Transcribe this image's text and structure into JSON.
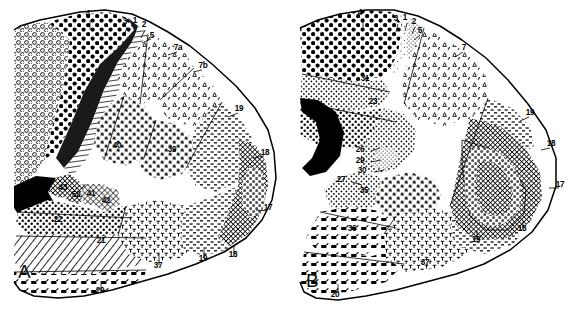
{
  "figure": {
    "background_color": "#ffffff",
    "ink_color": "#000000",
    "width": 574,
    "height": 318
  },
  "panels": [
    {
      "id": "A",
      "letter": "A",
      "view": "lateral",
      "letter_x": 18,
      "letter_y": 278,
      "labels": [
        {
          "text": "4",
          "x": 88,
          "y": 16,
          "lx1": 90,
          "ly1": 20,
          "lx2": 90,
          "ly2": 30
        },
        {
          "text": "3",
          "x": 125,
          "y": 24,
          "lx1": 127,
          "ly1": 27,
          "lx2": 124,
          "ly2": 36
        },
        {
          "text": "1",
          "x": 135,
          "y": 23,
          "lx1": 137,
          "ly1": 27,
          "lx2": 134,
          "ly2": 36
        },
        {
          "text": "2",
          "x": 144,
          "y": 27,
          "lx1": 145,
          "ly1": 30,
          "lx2": 141,
          "ly2": 38
        },
        {
          "text": "5",
          "x": 152,
          "y": 38,
          "lx1": 151,
          "ly1": 39,
          "lx2": 142,
          "ly2": 43
        },
        {
          "text": "7a",
          "x": 178,
          "y": 50,
          "lx1": 177,
          "ly1": 52,
          "lx2": 168,
          "ly2": 55
        },
        {
          "text": "7b",
          "x": 203,
          "y": 68,
          "lx1": 202,
          "ly1": 70,
          "lx2": 193,
          "ly2": 72
        },
        {
          "text": "19",
          "x": 239,
          "y": 111,
          "lx1": 238,
          "ly1": 113,
          "lx2": 228,
          "ly2": 117
        },
        {
          "text": "18",
          "x": 265,
          "y": 155,
          "lx1": 264,
          "ly1": 156,
          "lx2": 253,
          "ly2": 158
        },
        {
          "text": "17",
          "x": 268,
          "y": 210,
          "lx1": 267,
          "ly1": 211,
          "lx2": 256,
          "ly2": 210
        },
        {
          "text": "18",
          "x": 233,
          "y": 257,
          "lx1": 234,
          "ly1": 254,
          "lx2": 234,
          "ly2": 246
        },
        {
          "text": "19",
          "x": 203,
          "y": 261,
          "lx1": 204,
          "ly1": 258,
          "lx2": 204,
          "ly2": 249
        },
        {
          "text": "37",
          "x": 158,
          "y": 268,
          "lx1": 159,
          "ly1": 265,
          "lx2": 159,
          "ly2": 254
        },
        {
          "text": "20",
          "x": 100,
          "y": 293,
          "lx1": 101,
          "ly1": 290,
          "lx2": 101,
          "ly2": 281
        },
        {
          "text": "21",
          "x": 101,
          "y": 243,
          "lx1": null,
          "ly1": null,
          "lx2": null,
          "ly2": null
        },
        {
          "text": "22",
          "x": 58,
          "y": 222,
          "lx1": null,
          "ly1": null,
          "lx2": null,
          "ly2": null
        },
        {
          "text": "40",
          "x": 117,
          "y": 148,
          "lx1": null,
          "ly1": null,
          "lx2": null,
          "ly2": null
        },
        {
          "text": "39",
          "x": 172,
          "y": 152,
          "lx1": null,
          "ly1": null,
          "lx2": null,
          "ly2": null
        },
        {
          "text": "43",
          "x": 63,
          "y": 190,
          "lx1": null,
          "ly1": null,
          "lx2": null,
          "ly2": null
        },
        {
          "text": "52",
          "x": 76,
          "y": 197,
          "lx1": null,
          "ly1": null,
          "lx2": null,
          "ly2": null
        },
        {
          "text": "41",
          "x": 91,
          "y": 196,
          "lx1": null,
          "ly1": null,
          "lx2": null,
          "ly2": null
        },
        {
          "text": "42",
          "x": 106,
          "y": 203,
          "lx1": null,
          "ly1": null,
          "lx2": null,
          "ly2": null
        }
      ]
    },
    {
      "id": "B",
      "letter": "B",
      "view": "medial",
      "letter_x": 306,
      "letter_y": 287,
      "labels": [
        {
          "text": "4",
          "x": 360,
          "y": 15,
          "lx1": 363,
          "ly1": 18,
          "lx2": 363,
          "ly2": 28
        },
        {
          "text": "3",
          "x": 396,
          "y": 21,
          "lx1": 398,
          "ly1": 24,
          "lx2": 396,
          "ly2": 32
        },
        {
          "text": "1",
          "x": 405,
          "y": 20,
          "lx1": 407,
          "ly1": 23,
          "lx2": 405,
          "ly2": 31
        },
        {
          "text": "2",
          "x": 414,
          "y": 24,
          "lx1": 415,
          "ly1": 27,
          "lx2": 412,
          "ly2": 34
        },
        {
          "text": "5",
          "x": 420,
          "y": 33,
          "lx1": 420,
          "ly1": 35,
          "lx2": 414,
          "ly2": 40
        },
        {
          "text": "7",
          "x": 464,
          "y": 50,
          "lx1": 463,
          "ly1": 52,
          "lx2": 455,
          "ly2": 57
        },
        {
          "text": "31",
          "x": 365,
          "y": 81,
          "lx1": null,
          "ly1": null,
          "lx2": null,
          "ly2": null
        },
        {
          "text": "23",
          "x": 373,
          "y": 104,
          "lx1": null,
          "ly1": null,
          "lx2": null,
          "ly2": null
        },
        {
          "text": "19",
          "x": 530,
          "y": 115,
          "lx1": 529,
          "ly1": 117,
          "lx2": 520,
          "ly2": 121
        },
        {
          "text": "18",
          "x": 551,
          "y": 146,
          "lx1": 550,
          "ly1": 148,
          "lx2": 541,
          "ly2": 150
        },
        {
          "text": "17",
          "x": 560,
          "y": 187,
          "lx1": 559,
          "ly1": 188,
          "lx2": 549,
          "ly2": 188
        },
        {
          "text": "18",
          "x": 522,
          "y": 231,
          "lx1": 523,
          "ly1": 228,
          "lx2": 523,
          "ly2": 221
        },
        {
          "text": "19",
          "x": 476,
          "y": 242,
          "lx1": 477,
          "ly1": 239,
          "lx2": 477,
          "ly2": 231
        },
        {
          "text": "26",
          "x": 360,
          "y": 152,
          "lx1": 371,
          "ly1": 151,
          "lx2": 380,
          "ly2": 148
        },
        {
          "text": "29",
          "x": 360,
          "y": 163,
          "lx1": 371,
          "ly1": 162,
          "lx2": 381,
          "ly2": 160
        },
        {
          "text": "30",
          "x": 362,
          "y": 173,
          "lx1": 374,
          "ly1": 172,
          "lx2": 384,
          "ly2": 170
        },
        {
          "text": "27",
          "x": 341,
          "y": 182,
          "lx1": 352,
          "ly1": 182,
          "lx2": 362,
          "ly2": 185
        },
        {
          "text": "35",
          "x": 364,
          "y": 193,
          "lx1": null,
          "ly1": null,
          "lx2": null,
          "ly2": null
        },
        {
          "text": "36",
          "x": 352,
          "y": 231,
          "lx1": null,
          "ly1": null,
          "lx2": null,
          "ly2": null
        },
        {
          "text": "37",
          "x": 425,
          "y": 265,
          "lx1": null,
          "ly1": null,
          "lx2": null,
          "ly2": null
        },
        {
          "text": "20",
          "x": 335,
          "y": 297,
          "lx1": 338,
          "ly1": 293,
          "lx2": 338,
          "ly2": 284
        }
      ]
    }
  ]
}
